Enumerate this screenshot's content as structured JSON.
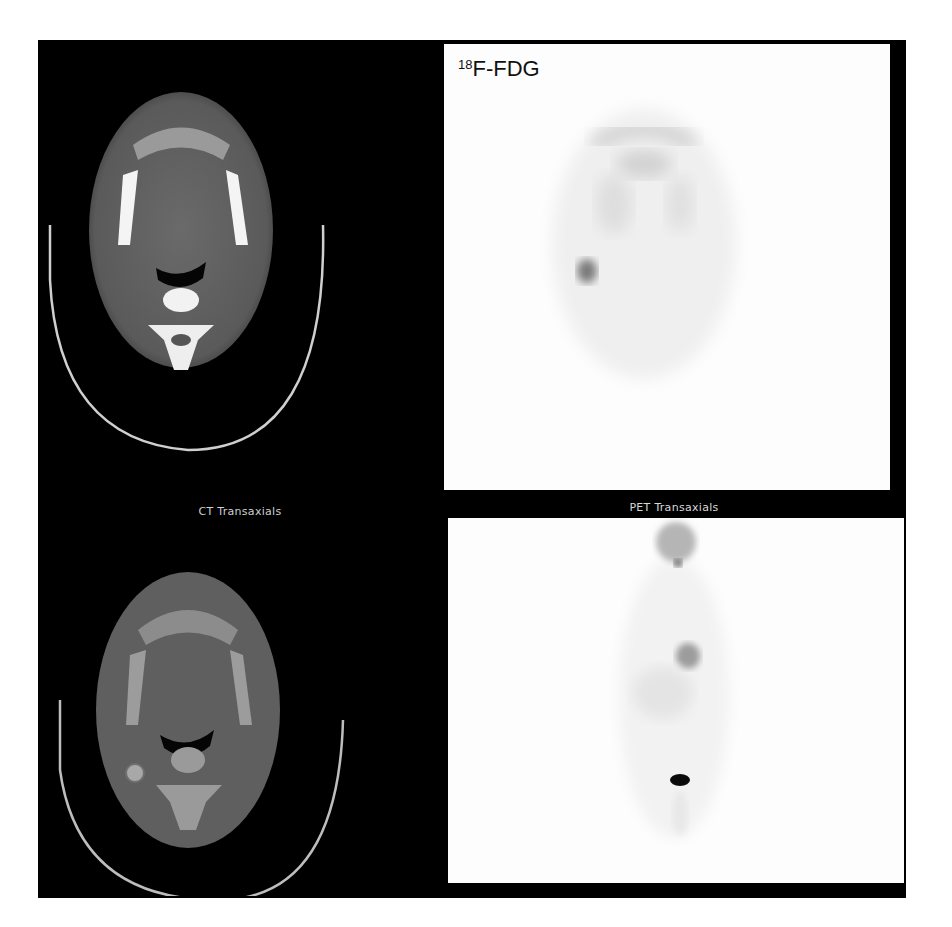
{
  "figure": {
    "tracer_label": {
      "isotope": "18",
      "compound": "F-FDG"
    },
    "captions": {
      "ct": "CT Transaxials",
      "pet": "PET Transaxials"
    },
    "panels": [
      {
        "id": "ct-top",
        "modality": "CT",
        "view": "transaxial",
        "window": "bone/soft-tissue"
      },
      {
        "id": "pet-top",
        "modality": "PET",
        "view": "transaxial",
        "finding": "focal uptake right neck node"
      },
      {
        "id": "ct-bottom",
        "modality": "CT",
        "view": "transaxial",
        "window": "soft-tissue"
      },
      {
        "id": "pet-bottom",
        "modality": "PET",
        "view": "maximum intensity projection (coronal)"
      }
    ],
    "colors": {
      "background": "#000000",
      "pet_background": "#fdfdfd",
      "caption": "#cfcfcf"
    }
  }
}
